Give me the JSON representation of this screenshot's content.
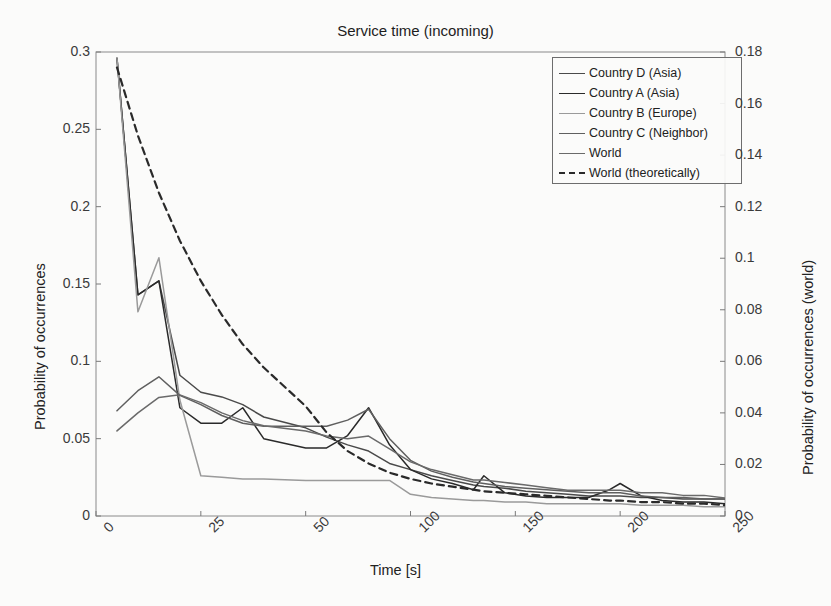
{
  "chart_data": {
    "type": "line",
    "title": "Service time (incoming)",
    "xlabel": "Time [s]",
    "ylabel": "Probability of occurrences",
    "ylabel_right": "Probability of occurrences (world)",
    "xticks": [
      0,
      25,
      50,
      100,
      150,
      200,
      250
    ],
    "xtick_labels": [
      "0",
      "25",
      "50",
      "100",
      "150",
      "200",
      "250"
    ],
    "yticks_left": [
      0,
      0.05,
      0.1,
      0.15,
      0.2,
      0.25,
      0.3
    ],
    "ytick_labels_left": [
      "0",
      "0.05",
      "0.1",
      "0.15",
      "0.2",
      "0.25",
      "0.3"
    ],
    "yticks_right": [
      0,
      0.02,
      0.04,
      0.06,
      0.08,
      0.1,
      0.12,
      0.14,
      0.16,
      0.18
    ],
    "ytick_labels_right": [
      "0",
      "0.02",
      "0.04",
      "0.06",
      "0.08",
      "0.1",
      "0.12",
      "0.14",
      "0.16",
      "0.18"
    ],
    "ylim_left": [
      0,
      0.3
    ],
    "ylim_right": [
      0,
      0.18
    ],
    "grid": false,
    "legend_position": "upper right",
    "x": [
      5,
      10,
      15,
      20,
      25,
      30,
      35,
      40,
      50,
      60,
      70,
      80,
      90,
      100,
      110,
      120,
      130,
      135,
      145,
      155,
      165,
      175,
      185,
      195,
      200,
      210,
      220,
      230,
      240,
      250
    ],
    "series": [
      {
        "name": "Country D (Asia)",
        "color": "#4a4a4a",
        "dash": "solid",
        "axis": "left",
        "values": [
          0.296,
          0.143,
          0.152,
          0.091,
          0.08,
          0.077,
          0.072,
          0.064,
          0.057,
          0.051,
          0.046,
          0.042,
          0.034,
          0.03,
          0.026,
          0.023,
          0.02,
          0.019,
          0.018,
          0.016,
          0.015,
          0.014,
          0.013,
          0.013,
          0.013,
          0.012,
          0.012,
          0.011,
          0.011,
          0.011
        ]
      },
      {
        "name": "Country A (Asia)",
        "color": "#2a2a2a",
        "dash": "solid",
        "axis": "left",
        "values": [
          0.296,
          0.143,
          0.152,
          0.07,
          0.06,
          0.06,
          0.07,
          0.05,
          0.044,
          0.044,
          0.052,
          0.07,
          0.046,
          0.03,
          0.024,
          0.021,
          0.017,
          0.026,
          0.015,
          0.013,
          0.012,
          0.012,
          0.012,
          0.017,
          0.021,
          0.013,
          0.01,
          0.009,
          0.009,
          0.008
        ]
      },
      {
        "name": "Country B (Europe)",
        "color": "#9a9a9a",
        "dash": "solid",
        "axis": "left",
        "values": [
          0.296,
          0.132,
          0.167,
          0.075,
          0.026,
          0.025,
          0.024,
          0.024,
          0.023,
          0.023,
          0.023,
          0.023,
          0.023,
          0.014,
          0.012,
          0.011,
          0.01,
          0.01,
          0.009,
          0.009,
          0.008,
          0.008,
          0.008,
          0.008,
          0.008,
          0.007,
          0.007,
          0.007,
          0.006,
          0.006
        ]
      },
      {
        "name": "Country C (Neighbor)",
        "color": "#5f5f5f",
        "dash": "solid",
        "axis": "left",
        "values": [
          0.068,
          0.081,
          0.09,
          0.078,
          0.072,
          0.065,
          0.06,
          0.058,
          0.058,
          0.058,
          0.062,
          0.069,
          0.05,
          0.036,
          0.029,
          0.025,
          0.022,
          0.021,
          0.019,
          0.018,
          0.017,
          0.016,
          0.015,
          0.015,
          0.015,
          0.013,
          0.012,
          0.012,
          0.011,
          0.011
        ]
      },
      {
        "name": "World",
        "color": "#6a6a6a",
        "dash": "solid",
        "axis": "right",
        "values": [
          0.033,
          0.04,
          0.046,
          0.047,
          0.044,
          0.04,
          0.037,
          0.035,
          0.033,
          0.031,
          0.03,
          0.031,
          0.026,
          0.021,
          0.018,
          0.016,
          0.014,
          0.014,
          0.013,
          0.012,
          0.011,
          0.01,
          0.01,
          0.01,
          0.01,
          0.009,
          0.009,
          0.008,
          0.008,
          0.007
        ]
      },
      {
        "name": "World (theoretically)",
        "color": "#2a2a2a",
        "dash": "dashed",
        "axis": "left",
        "values": [
          0.29,
          0.246,
          0.209,
          0.178,
          0.152,
          0.13,
          0.111,
          0.096,
          0.071,
          0.054,
          0.042,
          0.034,
          0.028,
          0.024,
          0.021,
          0.019,
          0.017,
          0.016,
          0.015,
          0.014,
          0.013,
          0.012,
          0.011,
          0.01,
          0.01,
          0.009,
          0.009,
          0.008,
          0.008,
          0.007
        ]
      }
    ]
  }
}
